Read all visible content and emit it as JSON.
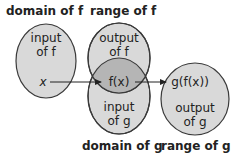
{
  "diagram": {
    "title_labels": {
      "domain_f": "domain of f",
      "range_f": "range of f",
      "domain_g": "domain of g",
      "range_g": "range of g"
    },
    "ellipses": {
      "input_f": {
        "line1": "input",
        "line2": "of f"
      },
      "output_f": {
        "line1": "output",
        "line2": "of f"
      },
      "input_g": {
        "line1": "input",
        "line2": "of g"
      },
      "output_g": {
        "line1": "output",
        "line2": "of g"
      }
    },
    "points": {
      "x": "x",
      "fx": "f(x)",
      "gfx": "g(f(x))"
    },
    "colors": {
      "fill": "#d9d9d9",
      "overlap": "#b5b5b5",
      "stroke": "#3a3a3a"
    }
  }
}
